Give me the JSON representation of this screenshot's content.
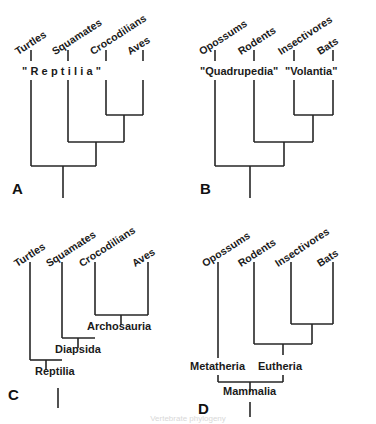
{
  "figure": {
    "background": "#ffffff",
    "line_color": "#262626",
    "caption_fragment": "Vertebrate       phylogeny"
  },
  "panels": [
    {
      "letter": "A",
      "tips": [
        "Turtles",
        "Squamates",
        "Crocodilians",
        "Aves"
      ],
      "group_labels": [
        {
          "text": "\"Reptilia\""
        }
      ],
      "clade_labels": []
    },
    {
      "letter": "B",
      "tips": [
        "Opossums",
        "Rodents",
        "Insectivores",
        "Bats"
      ],
      "group_labels": [
        {
          "text": "\"Quadrupedia\""
        },
        {
          "text": "\"Volantia\""
        }
      ],
      "clade_labels": []
    },
    {
      "letter": "C",
      "tips": [
        "Turtles",
        "Squamates",
        "Crocodilians",
        "Aves"
      ],
      "group_labels": [],
      "clade_labels": [
        {
          "text": "Archosauria"
        },
        {
          "text": "Diapsida"
        },
        {
          "text": "Reptilia"
        }
      ]
    },
    {
      "letter": "D",
      "tips": [
        "Opossums",
        "Rodents",
        "Insectivores",
        "Bats"
      ],
      "group_labels": [],
      "clade_labels": [
        {
          "text": "Metatheria"
        },
        {
          "text": "Eutheria"
        },
        {
          "text": "Mammalia"
        }
      ]
    }
  ]
}
